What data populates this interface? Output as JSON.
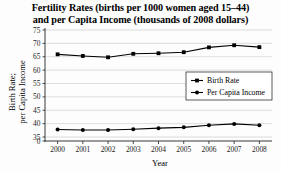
{
  "chart_data": {
    "type": "line",
    "title": "Fertility Rates (births per 1000 women aged 15–44) and per Capita Income (thousands of 2008 dollars)",
    "title_lines": [
      "Fertility Rates (births per 1000 women aged 15–44)",
      "and per Capita Income (thousands of 2008 dollars)"
    ],
    "xlabel": "Year",
    "ylabel": "Birth Rate; per Capita Income",
    "ylabel_lines": [
      "Birth Rate;",
      "per Capita Income"
    ],
    "categories": [
      2000,
      2001,
      2002,
      2003,
      2004,
      2005,
      2006,
      2007,
      2008
    ],
    "xtick_labels": [
      "2000",
      "2001",
      "2002",
      "2003",
      "2004",
      "2005",
      "2006",
      "2007",
      "2008"
    ],
    "ytick_labels": [
      "0",
      "35",
      "40",
      "45",
      "50",
      "55",
      "60",
      "65",
      "70",
      "75"
    ],
    "ytick_values": [
      0,
      35,
      40,
      45,
      50,
      55,
      60,
      65,
      70,
      75
    ],
    "ylim": [
      35,
      75
    ],
    "y_axis_broken": true,
    "y_break_from": 0,
    "y_break_to": 35,
    "grid": true,
    "grid_axis": "y",
    "legend_position": "center-right-inside",
    "series": [
      {
        "name": "Birth Rate",
        "marker": "square",
        "color": "#000000",
        "values": [
          65.9,
          65.3,
          64.8,
          66.1,
          66.3,
          66.7,
          68.5,
          69.3,
          68.6
        ]
      },
      {
        "name": "Per Capita Income",
        "marker": "circle",
        "color": "#000000",
        "values": [
          37.8,
          37.6,
          37.6,
          37.9,
          38.3,
          38.6,
          39.4,
          39.9,
          39.4
        ]
      }
    ]
  },
  "legend": {
    "entries": [
      {
        "label": "Birth Rate",
        "marker": "square"
      },
      {
        "label": "Per Capita Income",
        "marker": "circle"
      }
    ]
  }
}
